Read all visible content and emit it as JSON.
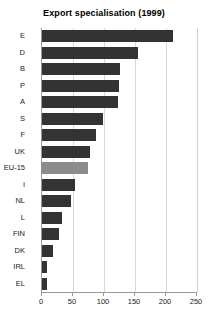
{
  "chart": {
    "title": "Export specialisation (1999)"
  },
  "chart_data": {
    "type": "bar",
    "orientation": "horizontal",
    "title": "Export specialisation (1999)",
    "xlabel": "",
    "ylabel": "",
    "xlim": [
      0,
      250
    ],
    "xticks": [
      0,
      50,
      100,
      150,
      200,
      250
    ],
    "grid": true,
    "legend": false,
    "highlight_category": "EU-15",
    "colors": {
      "bar": "#333333",
      "highlight_bar": "#8c8c8c",
      "grid": "#d8d8d8",
      "axis": "#9a9a9a",
      "text": "#1a1a1a",
      "background": "#ffffff"
    },
    "categories": [
      "E",
      "D",
      "B",
      "P",
      "A",
      "S",
      "F",
      "UK",
      "EU-15",
      "I",
      "NL",
      "L",
      "FIN",
      "DK",
      "IRL",
      "EL"
    ],
    "values": [
      211,
      155,
      126,
      124,
      122,
      98,
      87,
      77,
      74,
      53,
      47,
      32,
      27,
      18,
      8,
      8
    ]
  }
}
